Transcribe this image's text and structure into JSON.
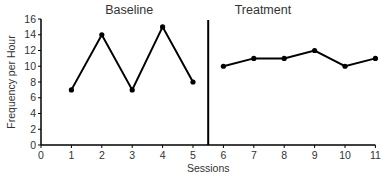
{
  "chart_data": {
    "type": "line",
    "title": "",
    "xlabel": "Sessions",
    "ylabel": "Frequency per Hour",
    "xlim": [
      0,
      11
    ],
    "ylim": [
      0,
      16
    ],
    "x_ticks": [
      0,
      1,
      2,
      3,
      4,
      5,
      6,
      7,
      8,
      9,
      10,
      11
    ],
    "y_ticks": [
      0,
      2,
      4,
      6,
      8,
      10,
      12,
      14,
      16
    ],
    "grid": false,
    "legend": null,
    "phase_change_line_x": 5.5,
    "series": [
      {
        "name": "Baseline",
        "x": [
          1,
          2,
          3,
          4,
          5
        ],
        "values": [
          7,
          14,
          7,
          15,
          8
        ]
      },
      {
        "name": "Treatment",
        "x": [
          6,
          7,
          8,
          9,
          10,
          11
        ],
        "values": [
          10,
          11,
          11,
          12,
          10,
          11
        ]
      }
    ],
    "annotations": [
      {
        "text": "Baseline",
        "x": 2.9,
        "y": 17.2
      },
      {
        "text": "Treatment",
        "x": 7.3,
        "y": 17.2
      }
    ]
  }
}
